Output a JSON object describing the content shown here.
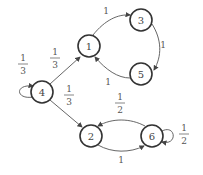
{
  "diagram": {
    "type": "markov-chain",
    "nodes": [
      {
        "id": "1",
        "label": "1"
      },
      {
        "id": "2",
        "label": "2"
      },
      {
        "id": "3",
        "label": "3"
      },
      {
        "id": "4",
        "label": "4"
      },
      {
        "id": "5",
        "label": "5"
      },
      {
        "id": "6",
        "label": "6"
      }
    ],
    "edges": [
      {
        "from": "4",
        "to": "4",
        "num": "1",
        "den": "3"
      },
      {
        "from": "4",
        "to": "1",
        "num": "1",
        "den": "3"
      },
      {
        "from": "4",
        "to": "2",
        "num": "1",
        "den": "3"
      },
      {
        "from": "1",
        "to": "3",
        "label": "1"
      },
      {
        "from": "3",
        "to": "5",
        "label": "1"
      },
      {
        "from": "5",
        "to": "1",
        "label": "1"
      },
      {
        "from": "2",
        "to": "6",
        "label": "1"
      },
      {
        "from": "6",
        "to": "2",
        "num": "1",
        "den": "2"
      },
      {
        "from": "6",
        "to": "6",
        "num": "1",
        "den": "2"
      }
    ]
  }
}
